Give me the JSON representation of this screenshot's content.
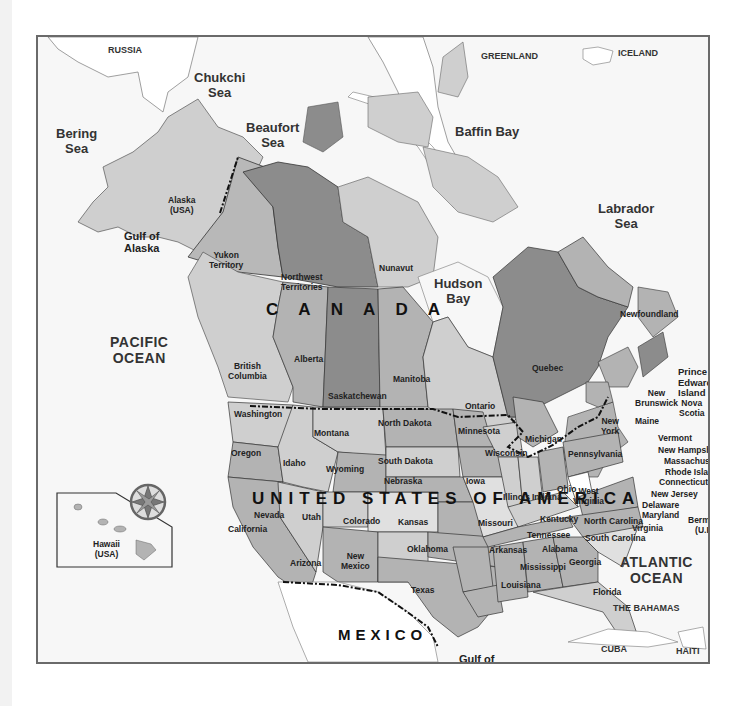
{
  "map": {
    "title": "North America political map",
    "colors": {
      "water": "#f7f7f7",
      "frame": "#6a6a6a",
      "land_light": "#cfcfcf",
      "land_mid": "#b3b3b3",
      "land_dark": "#8c8c8c",
      "land_darkest": "#7a7a7a",
      "foreign_land": "#ffffff"
    },
    "countries": {
      "canada": "C A N A D A",
      "usa": "UNITED STATES OF AMERICA",
      "mexico": "MEXICO",
      "russia": "RUSSIA",
      "greenland": "GREENLAND",
      "iceland": "ICELAND",
      "bahamas": "THE BAHAMAS",
      "cuba": "CUBA",
      "haiti": "HAITI",
      "bermuda_line1": "Bermuda",
      "bermuda_line2": "(U.K.)"
    },
    "water_bodies": {
      "chukchi_1": "Chukchi",
      "chukchi_2": "Sea",
      "beaufort_1": "Beaufort",
      "beaufort_2": "Sea",
      "bering_1": "Bering",
      "bering_2": "Sea",
      "baffin": "Baffin Bay",
      "labrador_1": "Labrador",
      "labrador_2": "Sea",
      "gulf_alaska_1": "Gulf of",
      "gulf_alaska_2": "Alaska",
      "hudson_1": "Hudson",
      "hudson_2": "Bay",
      "pacific_1": "PACIFIC",
      "pacific_2": "OCEAN",
      "atlantic_1": "ATLANTIC",
      "atlantic_2": "OCEAN",
      "gulf_mexico_1": "Gulf of",
      "gulf_mexico_2": "Mexico"
    },
    "canada_regions": {
      "yukon_1": "Yukon",
      "yukon_2": "Territory",
      "nwt_1": "Northwest",
      "nwt_2": "Territories",
      "nunavut": "Nunavut",
      "bc_1": "British",
      "bc_2": "Columbia",
      "alberta": "Alberta",
      "saskatchewan": "Saskatchewan",
      "manitoba": "Manitoba",
      "ontario": "Ontario",
      "quebec": "Quebec",
      "newfoundland": "Newfoundland",
      "pei_1": "Prince",
      "pei_2": "Edward",
      "pei_3": "Island",
      "nb_1": "New",
      "nb_2": "Brunswick",
      "ns_1": "Nova",
      "ns_2": "Scotia"
    },
    "us_states": {
      "alaska_1": "Alaska",
      "alaska_2": "(USA)",
      "hawaii_1": "Hawaii",
      "hawaii_2": "(USA)",
      "washington": "Washington",
      "oregon": "Oregon",
      "california": "California",
      "idaho": "Idaho",
      "nevada": "Nevada",
      "montana": "Montana",
      "wyoming": "Wyoming",
      "utah": "Utah",
      "arizona": "Arizona",
      "colorado": "Colorado",
      "new_mexico_1": "New",
      "new_mexico_2": "Mexico",
      "north_dakota": "North Dakota",
      "south_dakota": "South Dakota",
      "nebraska": "Nebraska",
      "kansas": "Kansas",
      "oklahoma": "Oklahoma",
      "texas": "Texas",
      "minnesota": "Minnesota",
      "iowa": "Iowa",
      "missouri": "Missouri",
      "arkansas": "Arkansas",
      "louisiana": "Louisiana",
      "wisconsin": "Wisconsin",
      "illinois": "Illinois",
      "michigan": "Michigan",
      "indiana": "Indiana",
      "ohio": "Ohio",
      "kentucky": "Kentucky",
      "tennessee": "Tennessee",
      "mississippi": "Mississippi",
      "alabama": "Alabama",
      "georgia": "Georgia",
      "florida": "Florida",
      "south_carolina": "South Carolina",
      "north_carolina": "North Carolina",
      "virginia": "Virginia",
      "west_virginia_1": "West",
      "west_virginia_2": "Virginia",
      "pennsylvania": "Pennsylvania",
      "new_york_1": "New",
      "new_york_2": "York",
      "maine": "Maine",
      "vermont": "Vermont",
      "new_hampshire": "New Hampshire",
      "massachusetts": "Massachusetts",
      "rhode_island": "Rhode Island",
      "connecticut": "Connecticut",
      "new_jersey": "New Jersey",
      "delaware": "Delaware",
      "maryland": "Maryland"
    },
    "compass": {
      "n": "N",
      "s": "S",
      "e": "E",
      "w": "W"
    }
  }
}
